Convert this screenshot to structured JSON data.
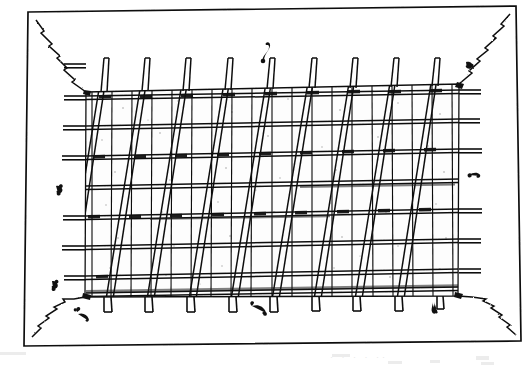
{
  "figure": {
    "medium": "scanned pen-and-ink line drawing",
    "background_color": "#ffffff",
    "ink_color": "#111111",
    "canvas": {
      "width": 529,
      "height": 369
    }
  },
  "outer_frame": {
    "name": "outer-rectangle",
    "stroke_width": 1.6,
    "points": [
      [
        28,
        12
      ],
      [
        516,
        6
      ],
      [
        521,
        341
      ],
      [
        24,
        346
      ]
    ],
    "corner_diagonals": [
      {
        "name": "top-left-diagonal",
        "from": [
          36,
          20
        ],
        "to": [
          86,
          92
        ],
        "style": "zigzag"
      },
      {
        "name": "top-right-diagonal",
        "from": [
          510,
          14
        ],
        "to": [
          459,
          84
        ],
        "style": "zigzag"
      },
      {
        "name": "bottom-left-diagonal",
        "from": [
          32,
          336
        ],
        "to": [
          85,
          297
        ],
        "style": "zigzag"
      },
      {
        "name": "bottom-right-diagonal",
        "from": [
          515,
          334
        ],
        "to": [
          458,
          296
        ],
        "style": "zigzag"
      }
    ]
  },
  "lattice_panel": {
    "name": "lattice-panel",
    "corners": {
      "top_left": [
        86,
        92
      ],
      "top_right": [
        459,
        84
      ],
      "bottom_right": [
        458,
        296
      ],
      "bottom_left": [
        85,
        297
      ]
    },
    "fill": "#fdfdfd",
    "speckle_count": 46
  },
  "horizontal_rails": {
    "name": "horizontal-rails",
    "count": 9,
    "double_line": true,
    "y_positions_left": [
      66,
      96,
      126,
      156,
      186,
      216,
      246,
      276,
      295
    ],
    "y_positions_right": [
      60,
      90,
      119,
      149,
      179,
      209,
      239,
      269,
      289
    ],
    "protrusion_left_px": 22,
    "protrusion_right_px": 22,
    "protruding_indices_left": [
      1,
      2,
      3,
      5,
      6
    ],
    "protruding_indices_right": [
      1,
      3,
      5,
      6,
      7
    ]
  },
  "vertical_bars": {
    "name": "vertical-bars",
    "count": 19,
    "x_start": 92,
    "x_end": 452,
    "stroke_width": 1.2
  },
  "slanted_poles": {
    "name": "slanted-poles",
    "description": "A-frame style leaning poles, each drawn as a narrow double-line wedge, tops near the panel top edge and feet splaying below the panel bottom",
    "count": 9,
    "top_x": [
      104,
      145,
      186,
      228,
      270,
      312,
      353,
      394,
      435
    ],
    "foot_x": [
      63,
      104,
      145,
      187,
      229,
      270,
      312,
      353,
      395
    ],
    "top_y": 58,
    "foot_y": 312,
    "width_top_px": 5,
    "width_foot_px": 7
  },
  "cross_ties": {
    "name": "cross-ties",
    "description": "short bound ties where poles cross the rails",
    "count": 28
  },
  "creature_marks": {
    "name": "worm-marks",
    "description": "small curled larva-like ink squiggles scattered inside and around the frame",
    "count": 8,
    "positions": [
      [
        264,
        44
      ],
      [
        466,
        62
      ],
      [
        56,
        186
      ],
      [
        469,
        175
      ],
      [
        52,
        281
      ],
      [
        252,
        306
      ],
      [
        432,
        302
      ],
      [
        78,
        314
      ]
    ]
  },
  "caption_ghost": {
    "name": "scan-artifact-caption",
    "text": "· ·   ·   ·      ··",
    "visible": false
  }
}
